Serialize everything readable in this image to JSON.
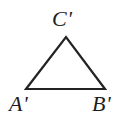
{
  "figure": {
    "kind": "geometry-diagram",
    "canvas": {
      "width": 124,
      "height": 129,
      "background_color": "#ffffff"
    },
    "stroke": {
      "color": "#232323",
      "width": 2.2
    },
    "shape": {
      "name": "triangle",
      "fill": "none",
      "points": "26,89 105,89 66,37",
      "vertices": [
        {
          "id": "A'",
          "x": 26,
          "y": 89
        },
        {
          "id": "B'",
          "x": 105,
          "y": 89
        },
        {
          "id": "C'",
          "x": 66,
          "y": 37
        }
      ]
    },
    "labels": {
      "apex": "C'",
      "bottom_left": "A'",
      "bottom_right": "B'"
    }
  }
}
